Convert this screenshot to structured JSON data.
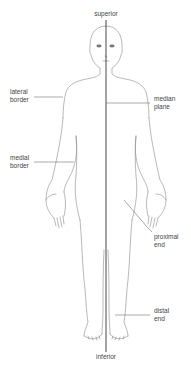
{
  "colors": {
    "outline": "#8a8a8a",
    "axis": "#333333",
    "leader": "#555555",
    "text": "#444444",
    "background": "#ffffff"
  },
  "labels": {
    "superior": "superior",
    "inferior": "inferior",
    "lateral_border": {
      "line1": "lateral",
      "line2": "border"
    },
    "median_plane": {
      "line1": "median",
      "line2": "plane"
    },
    "medial_border": {
      "line1": "medial",
      "line2": "border"
    },
    "proximal_end": {
      "line1": "proximal",
      "line2": "end"
    },
    "distal_end": {
      "line1": "distal",
      "line2": "end"
    }
  }
}
